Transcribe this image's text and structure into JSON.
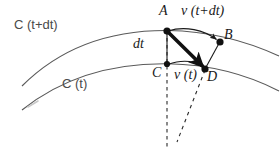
{
  "figure": {
    "background_color": "#ffffff",
    "stroke_color": "#555555",
    "ink_color": "#1a1a1a",
    "curves": [
      {
        "name": "C(t+dt)",
        "label": "C (t+dt)",
        "description": "upper outer arc"
      },
      {
        "name": "C(t)",
        "label": "C (t)",
        "description": "lower inner arc"
      }
    ],
    "points": [
      {
        "id": "A",
        "label": "A",
        "x": 167,
        "y": 31,
        "on_curve": "C(t+dt)"
      },
      {
        "id": "B",
        "label": "B",
        "x": 220,
        "y": 42,
        "on_curve": "C(t+dt)"
      },
      {
        "id": "C",
        "label": "C",
        "x": 167,
        "y": 64,
        "on_curve": "C(t)"
      },
      {
        "id": "D",
        "label": "D",
        "x": 205,
        "y": 69,
        "on_curve": "C(t)"
      }
    ],
    "vectors": [
      {
        "id": "v-t-plus-dt",
        "label": "v (t+dt)",
        "from": "A",
        "to": "B",
        "style": "thin-arrow"
      },
      {
        "id": "v-t",
        "label": "v (t)",
        "from": "C",
        "to": "D",
        "style": "thin-arrow"
      },
      {
        "id": "displacement",
        "from": "A",
        "to": "D",
        "style": "thick-arrow"
      },
      {
        "id": "dt-segment",
        "label": "dt",
        "from": "A",
        "to": "C",
        "style": "thin-segment"
      },
      {
        "id": "D-to-B",
        "from": "D",
        "to": "B",
        "style": "thin-segment"
      }
    ],
    "dashed_lines": [
      {
        "id": "vertical-through-C",
        "from_x": 167,
        "from_y": 31,
        "to_x": 167,
        "to_y": 148
      },
      {
        "id": "slanted-from-D",
        "from_x": 205,
        "from_y": 69,
        "to_x": 178,
        "to_y": 140
      }
    ],
    "labels": {
      "point_a": "A",
      "point_b": "B",
      "point_c": "C",
      "point_d": "D",
      "v_t_plus_dt": "ν (t+dt)",
      "v_t": "ν (t)",
      "dt": "dt",
      "curve_upper": "C (t+dt)",
      "curve_lower": "C (t)"
    }
  }
}
